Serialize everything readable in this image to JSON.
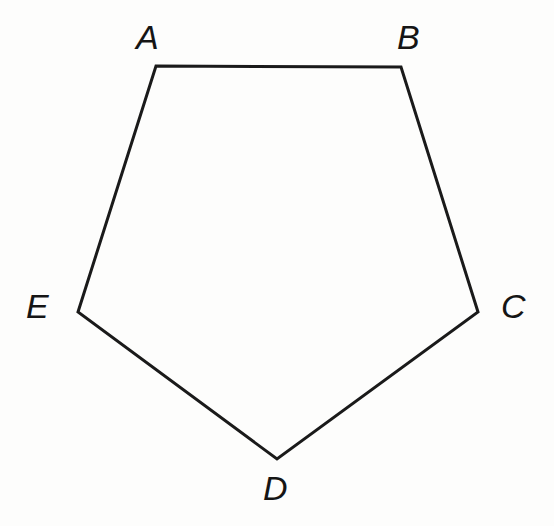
{
  "figure": {
    "name": "pentagon-ABCDE",
    "kind": "polygon",
    "sides": 5,
    "background_color": "#fdfdfc",
    "stroke_color": "#1a1a1a",
    "stroke_width": 3,
    "fill": "none",
    "canvas": {
      "width": 554,
      "height": 526
    },
    "vertices": [
      {
        "id": "A",
        "label": "A",
        "x": 156,
        "y": 66,
        "label_x": 136,
        "label_y": 20
      },
      {
        "id": "B",
        "label": "B",
        "x": 401,
        "y": 67,
        "label_x": 397,
        "label_y": 20
      },
      {
        "id": "C",
        "label": "C",
        "x": 478,
        "y": 312,
        "label_x": 501,
        "label_y": 289
      },
      {
        "id": "D",
        "label": "D",
        "x": 277,
        "y": 459,
        "label_x": 263,
        "label_y": 471
      },
      {
        "id": "E",
        "label": "E",
        "x": 78,
        "y": 312,
        "label_x": 26,
        "label_y": 289
      }
    ],
    "edges": [
      {
        "id": "AB",
        "from": "A",
        "to": "B"
      },
      {
        "id": "BC",
        "from": "B",
        "to": "C"
      },
      {
        "id": "CD",
        "from": "C",
        "to": "D"
      },
      {
        "id": "DE",
        "from": "D",
        "to": "E"
      },
      {
        "id": "EA",
        "from": "E",
        "to": "A"
      }
    ],
    "points_attr": "156,66 401,67 478,312 277,459 78,312"
  },
  "labels": {
    "A": "A",
    "B": "B",
    "C": "C",
    "D": "D",
    "E": "E"
  }
}
